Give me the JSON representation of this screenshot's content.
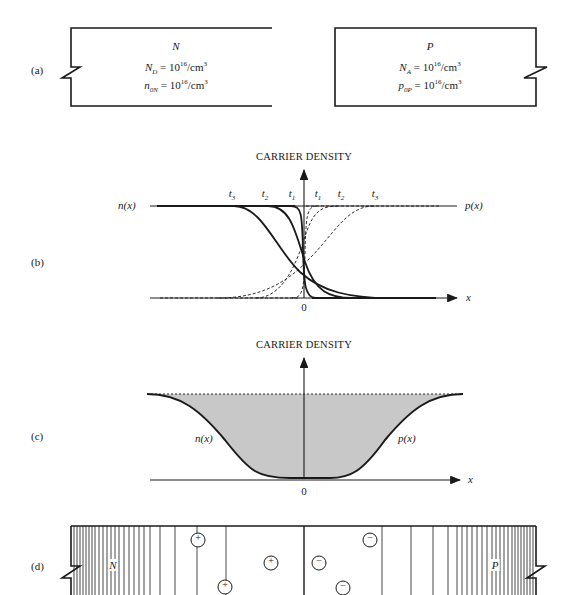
{
  "figure": {
    "panels": {
      "a": {
        "label": "(a)",
        "n_region": {
          "title": "N",
          "line1_sym": "N",
          "line1_sub": "D",
          "line1_rest": " = 10",
          "line1_exp": "16",
          "line1_unit": "/cm",
          "line1_unit_exp": "3",
          "line2_sym": "n",
          "line2_sub": "0N",
          "line2_rest": " = 10",
          "line2_exp": "16",
          "line2_unit": "/cm",
          "line2_unit_exp": "3"
        },
        "p_region": {
          "title": "P",
          "line1_sym": "N",
          "line1_sub": "A",
          "line1_rest": " = 10",
          "line1_exp": "16",
          "line1_unit": "/cm",
          "line1_unit_exp": "3",
          "line2_sym": "p",
          "line2_sub": "0P",
          "line2_rest": " = 10",
          "line2_exp": "16",
          "line2_unit": "/cm",
          "line2_unit_exp": "3"
        }
      },
      "b": {
        "label": "(b)",
        "y_axis_title": "CARRIER DENSITY",
        "x_axis_label": "x",
        "origin_label": "0",
        "left_curve_label": "n(x)",
        "right_curve_label": "p(x)",
        "time_labels_left": [
          {
            "sym": "t",
            "sub": "3"
          },
          {
            "sym": "t",
            "sub": "2"
          },
          {
            "sym": "t",
            "sub": "1"
          }
        ],
        "time_labels_right": [
          {
            "sym": "t",
            "sub": "1"
          },
          {
            "sym": "t",
            "sub": "2"
          },
          {
            "sym": "t",
            "sub": "3"
          }
        ]
      },
      "c": {
        "label": "(c)",
        "y_axis_title": "CARRIER DENSITY",
        "x_axis_label": "x",
        "origin_label": "0",
        "left_curve_label": "n(x)",
        "right_curve_label": "p(x)",
        "fill_color": "#c8c8c8"
      },
      "d": {
        "label": "(d)",
        "left_region_label": "N",
        "right_region_label": "P",
        "positive_ion_symbol": "+",
        "negative_ion_symbol": "−",
        "positive_ion_count": 3,
        "negative_ion_count": 3
      }
    },
    "colors": {
      "line": "#1a1a1a",
      "shade": "#c8c8c8",
      "background": "#ffffff"
    }
  }
}
